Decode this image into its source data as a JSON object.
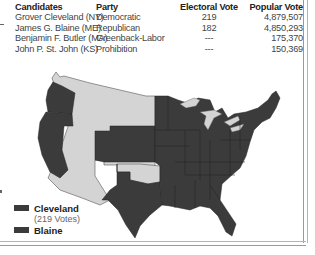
{
  "table": {
    "headers": [
      "Candidates",
      "Party",
      "Electoral Vote",
      "Popular Vote"
    ],
    "rows": [
      {
        "candidate": "Grover Cleveland (NY)",
        "party": "Democratic",
        "electoral": "219",
        "popular": "4,879,507"
      },
      {
        "candidate": "James G. Blaine (ME)",
        "party": "Republican",
        "electoral": "182",
        "popular": "4,850,293"
      },
      {
        "candidate": "Benjamin F. Butler (MA)",
        "party": "Greenback-Labor",
        "electoral": "---",
        "popular": "175,370"
      },
      {
        "candidate": "John P. St. John (KS)",
        "party": "Prohibition",
        "electoral": "---",
        "popular": "150,369"
      }
    ]
  },
  "legend": {
    "items": [
      {
        "label": "Cleveland",
        "sub": "(219 Votes)",
        "color": "#3b3b3b"
      },
      {
        "label": "Blaine",
        "color": "#3b3b3b"
      }
    ]
  },
  "map": {
    "state_color": "#3b3b3b",
    "territory_color": "#d4d4d4",
    "border_color": "#222222"
  }
}
